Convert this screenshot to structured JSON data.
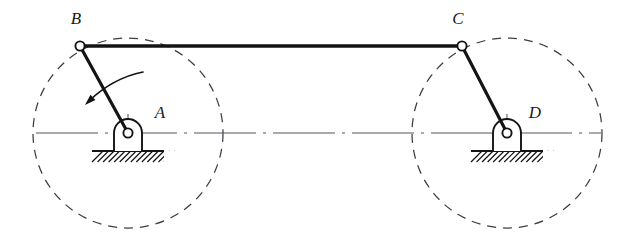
{
  "figure": {
    "kind": "mechanism-diagram",
    "background_color": "#ffffff",
    "line_color": "#1a1a1a",
    "thin_line_color": "#55555a",
    "canvas": {
      "width": 632,
      "height": 243
    }
  },
  "labels": {
    "b": "B",
    "c": "C",
    "a": "A",
    "d": "D"
  },
  "label_positions": {
    "b": {
      "x": 76,
      "y": 24
    },
    "c": {
      "x": 458,
      "y": 24
    },
    "a": {
      "x": 160,
      "y": 118
    },
    "d": {
      "x": 535,
      "y": 118
    }
  },
  "joints": {
    "a": {
      "x": 128,
      "y": 133,
      "type": "fixed-pivot",
      "radius": 4.6
    },
    "b": {
      "x": 80,
      "y": 46,
      "type": "pin-joint",
      "radius": 4.6
    },
    "c": {
      "x": 462,
      "y": 46,
      "type": "pin-joint",
      "radius": 4.6
    },
    "d": {
      "x": 507,
      "y": 133,
      "type": "fixed-pivot",
      "radius": 4.6
    }
  },
  "links": [
    {
      "name": "crank-ab",
      "from": "a",
      "to": "b",
      "width": 3.2
    },
    {
      "name": "coupler-bc",
      "from": "b",
      "to": "c",
      "width": 3.4
    },
    {
      "name": "crank-dc",
      "from": "d",
      "to": "c",
      "width": 3.2
    }
  ],
  "crank_circles": [
    {
      "name": "crank-circle-a",
      "cx": 128,
      "cy": 133,
      "r": 95,
      "style": "dashed"
    },
    {
      "name": "crank-circle-d",
      "cx": 507,
      "cy": 133,
      "r": 95,
      "style": "dashed"
    }
  ],
  "centerline": {
    "y": 133,
    "x_start": 36,
    "x_end": 601,
    "style": "dash-dot",
    "tick_marks_x": [
      128,
      507
    ]
  },
  "rotation_arrow": {
    "name": "rotation-direction-arrow",
    "description": "curved arrow indicating crank AB rotation direction (counter-clockwise sweep toward lower-left)",
    "start": {
      "x": 143,
      "y": 72
    },
    "control": {
      "x": 113,
      "y": 78
    },
    "end": {
      "x": 89,
      "y": 101
    },
    "arrow_tip": {
      "x": 85,
      "y": 105
    }
  },
  "supports": [
    {
      "name": "ground-support-a",
      "pivot_x": 128,
      "pivot_y": 133,
      "bearing_radius": 14,
      "base_left": 111,
      "base_right": 145,
      "base_bottom": 151,
      "ground_left": 92,
      "ground_right": 164,
      "ground_y": 151,
      "hatch_count": 13,
      "hatch_depth": 11
    },
    {
      "name": "ground-support-d",
      "pivot_x": 507,
      "pivot_y": 133,
      "bearing_radius": 14,
      "base_left": 490,
      "base_right": 524,
      "base_bottom": 151,
      "ground_left": 471,
      "ground_right": 543,
      "ground_y": 151,
      "hatch_count": 13,
      "hatch_depth": 11
    }
  ]
}
